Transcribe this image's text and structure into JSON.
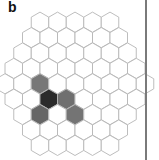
{
  "panel": {
    "label": "b"
  },
  "grid": {
    "type": "hexagonal",
    "orientation": "pointy-top",
    "row_lengths": [
      5,
      6,
      7,
      8,
      9,
      8,
      7,
      6,
      5
    ],
    "cell_width": 17.5,
    "row_spacing": 15.4,
    "origin_center_x": 75,
    "first_row_center_y": 22.2,
    "colors": {
      "empty": "#ffffff",
      "stroke": "#b5b5b5",
      "medium": "#6f6f6f",
      "dark": "#2b2b2b"
    },
    "filled_cells": [
      {
        "row": 4,
        "col": 2,
        "shade": "medium",
        "color": "#777777"
      },
      {
        "row": 5,
        "col": 2,
        "shade": "dark",
        "color": "#2b2b2b"
      },
      {
        "row": 5,
        "col": 3,
        "shade": "medium",
        "color": "#6f6f6f"
      },
      {
        "row": 6,
        "col": 1,
        "shade": "medium",
        "color": "#666666"
      },
      {
        "row": 6,
        "col": 3,
        "shade": "medium",
        "color": "#747474"
      }
    ]
  }
}
